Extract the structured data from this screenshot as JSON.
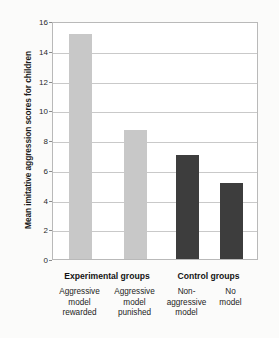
{
  "chart_data": {
    "type": "bar",
    "title": "",
    "xlabel": "",
    "ylabel": "Mean imitative aggression scores for children",
    "ylim": [
      0,
      16
    ],
    "ytick_step": 2,
    "yticks": [
      0,
      2,
      4,
      6,
      8,
      10,
      12,
      14,
      16
    ],
    "ytick_labels": [
      "0",
      "2",
      "4",
      "6",
      "8",
      "10",
      "12",
      "14",
      "16"
    ],
    "grid": true,
    "legend": "none",
    "categories": [
      "Aggressive model rewarded",
      "Aggressive model punished",
      "Non-aggressive model",
      "No model"
    ],
    "values": [
      15.1,
      8.7,
      7.0,
      5.1
    ],
    "bar_colors": [
      "#c8c8c8",
      "#c8c8c8",
      "#3d3d3d",
      "#3d3d3d"
    ],
    "groups": [
      {
        "label": "Experimental groups",
        "categories": [
          0,
          1
        ]
      },
      {
        "label": "Control groups",
        "categories": [
          2,
          3
        ]
      }
    ]
  },
  "axis": {
    "y_title": "Mean imitative aggression scores for children",
    "ticks": [
      {
        "value": 16,
        "label": "16"
      },
      {
        "value": 14,
        "label": "14"
      },
      {
        "value": 12,
        "label": "12"
      },
      {
        "value": 10,
        "label": "10"
      },
      {
        "value": 8,
        "label": "8"
      },
      {
        "value": 6,
        "label": "6"
      },
      {
        "value": 4,
        "label": "4"
      },
      {
        "value": 2,
        "label": "2"
      },
      {
        "value": 0,
        "label": "0"
      }
    ]
  },
  "groups": [
    {
      "label": "Experimental groups"
    },
    {
      "label": "Control groups"
    }
  ],
  "bars": [
    {
      "label_lines": [
        "Aggressive",
        "model",
        "rewarded"
      ],
      "value": 15.1,
      "color": "#c8c8c8"
    },
    {
      "label_lines": [
        "Aggressive",
        "model",
        "punished"
      ],
      "value": 8.7,
      "color": "#c8c8c8"
    },
    {
      "label_lines": [
        "Non-",
        "aggressive",
        "model"
      ],
      "value": 7.0,
      "color": "#3d3d3d"
    },
    {
      "label_lines": [
        "No",
        "model"
      ],
      "value": 5.1,
      "color": "#3d3d3d"
    }
  ],
  "colors": {
    "light_bar": "#c8c8c8",
    "dark_bar": "#3d3d3d",
    "gridline": "#c9c9c9",
    "frame": "#b9b9b9",
    "plot_background": "#ffffff",
    "page_background": "#fbfbfa",
    "text": "#1b1b1b"
  }
}
